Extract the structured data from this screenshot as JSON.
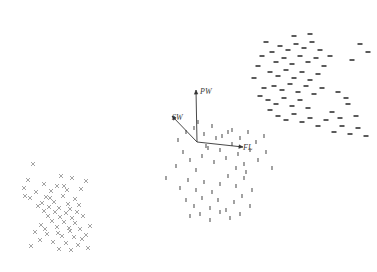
{
  "figure": {
    "name": "scatter-biplot",
    "background_color": "#ffffff",
    "width": 377,
    "height": 272,
    "title": "",
    "xlabel": "",
    "ylabel": "",
    "grid": false,
    "axes_visible": false,
    "legend": "none"
  },
  "chart_data": {
    "type": "scatter",
    "title": "",
    "xlabel": "",
    "ylabel": "",
    "xlim": [
      0,
      377
    ],
    "ylim": [
      272,
      0
    ],
    "grid": false,
    "legend_position": "none",
    "annotations": [
      {
        "text": "PW",
        "x": 200,
        "y": 94,
        "style": "italic"
      },
      {
        "text": "SW",
        "x": 172,
        "y": 120,
        "style": "italic"
      },
      {
        "text": "FL",
        "x": 243,
        "y": 150,
        "style": "italic"
      }
    ],
    "vectors": {
      "origin": {
        "x": 197,
        "y": 142
      },
      "arrows": [
        {
          "label": "PW",
          "x": 196,
          "y": 90,
          "color": "#333333"
        },
        {
          "label": "SW",
          "x": 172,
          "y": 116,
          "color": "#333333"
        },
        {
          "label": "FL",
          "x": 243,
          "y": 147,
          "color": "#333333"
        }
      ]
    },
    "series": [
      {
        "name": "cluster-lower-left",
        "marker": "x",
        "color": "#9a9a9a",
        "size": 4,
        "points": [
          [
            33,
            164
          ],
          [
            28,
            180
          ],
          [
            61,
            176
          ],
          [
            72,
            178
          ],
          [
            44,
            184
          ],
          [
            57,
            186
          ],
          [
            86,
            181
          ],
          [
            24,
            188
          ],
          [
            36,
            192
          ],
          [
            51,
            191
          ],
          [
            67,
            190
          ],
          [
            81,
            189
          ],
          [
            30,
            198
          ],
          [
            46,
            197
          ],
          [
            63,
            196
          ],
          [
            75,
            199
          ],
          [
            42,
            203
          ],
          [
            54,
            202
          ],
          [
            68,
            204
          ],
          [
            49,
            207
          ],
          [
            59,
            208
          ],
          [
            70,
            209
          ],
          [
            44,
            211
          ],
          [
            55,
            212
          ],
          [
            66,
            213
          ],
          [
            77,
            212
          ],
          [
            48,
            216
          ],
          [
            60,
            217
          ],
          [
            72,
            218
          ],
          [
            83,
            216
          ],
          [
            52,
            221
          ],
          [
            64,
            222
          ],
          [
            75,
            223
          ],
          [
            41,
            225
          ],
          [
            57,
            227
          ],
          [
            69,
            228
          ],
          [
            80,
            229
          ],
          [
            35,
            232
          ],
          [
            47,
            234
          ],
          [
            62,
            236
          ],
          [
            74,
            237
          ],
          [
            86,
            235
          ],
          [
            40,
            240
          ],
          [
            53,
            242
          ],
          [
            66,
            243
          ],
          [
            78,
            245
          ],
          [
            31,
            246
          ],
          [
            59,
            249
          ],
          [
            71,
            250
          ],
          [
            88,
            248
          ],
          [
            25,
            196
          ],
          [
            38,
            206
          ],
          [
            50,
            198
          ],
          [
            64,
            186
          ],
          [
            79,
            205
          ],
          [
            90,
            226
          ],
          [
            45,
            229
          ],
          [
            58,
            233
          ],
          [
            70,
            231
          ],
          [
            82,
            239
          ]
        ]
      },
      {
        "name": "cluster-center",
        "marker": "tick",
        "color": "#555555",
        "size": 4,
        "points": [
          [
            166,
            178
          ],
          [
            176,
            166
          ],
          [
            183,
            152
          ],
          [
            190,
            160
          ],
          [
            196,
            170
          ],
          [
            202,
            156
          ],
          [
            208,
            148
          ],
          [
            214,
            162
          ],
          [
            220,
            150
          ],
          [
            226,
            158
          ],
          [
            232,
            144
          ],
          [
            238,
            154
          ],
          [
            244,
            164
          ],
          [
            250,
            150
          ],
          [
            180,
            188
          ],
          [
            188,
            180
          ],
          [
            196,
            190
          ],
          [
            204,
            182
          ],
          [
            212,
            192
          ],
          [
            220,
            184
          ],
          [
            228,
            176
          ],
          [
            236,
            186
          ],
          [
            244,
            178
          ],
          [
            252,
            190
          ],
          [
            186,
            200
          ],
          [
            194,
            206
          ],
          [
            202,
            198
          ],
          [
            210,
            208
          ],
          [
            218,
            200
          ],
          [
            226,
            210
          ],
          [
            234,
            202
          ],
          [
            242,
            196
          ],
          [
            250,
            206
          ],
          [
            190,
            216
          ],
          [
            200,
            214
          ],
          [
            210,
            220
          ],
          [
            220,
            212
          ],
          [
            230,
            218
          ],
          [
            240,
            214
          ],
          [
            178,
            140
          ],
          [
            186,
            132
          ],
          [
            194,
            128
          ],
          [
            204,
            134
          ],
          [
            212,
            126
          ],
          [
            222,
            136
          ],
          [
            232,
            130
          ],
          [
            240,
            138
          ],
          [
            248,
            132
          ],
          [
            256,
            142
          ],
          [
            264,
            136
          ],
          [
            258,
            160
          ],
          [
            266,
            152
          ],
          [
            272,
            168
          ],
          [
            246,
            172
          ],
          [
            236,
            168
          ],
          [
            228,
            132
          ],
          [
            216,
            138
          ],
          [
            206,
            146
          ],
          [
            198,
            122
          ]
        ]
      },
      {
        "name": "cluster-upper-right",
        "marker": "dash",
        "color": "#4a4a4a",
        "size": 5,
        "points": [
          [
            272,
            52
          ],
          [
            280,
            46
          ],
          [
            288,
            50
          ],
          [
            296,
            44
          ],
          [
            304,
            48
          ],
          [
            312,
            42
          ],
          [
            320,
            50
          ],
          [
            276,
            62
          ],
          [
            284,
            58
          ],
          [
            292,
            64
          ],
          [
            300,
            56
          ],
          [
            308,
            62
          ],
          [
            316,
            58
          ],
          [
            324,
            66
          ],
          [
            270,
            72
          ],
          [
            278,
            76
          ],
          [
            286,
            70
          ],
          [
            294,
            78
          ],
          [
            302,
            72
          ],
          [
            310,
            80
          ],
          [
            318,
            74
          ],
          [
            274,
            86
          ],
          [
            282,
            90
          ],
          [
            290,
            84
          ],
          [
            298,
            92
          ],
          [
            306,
            86
          ],
          [
            314,
            94
          ],
          [
            322,
            88
          ],
          [
            268,
            100
          ],
          [
            276,
            104
          ],
          [
            284,
            98
          ],
          [
            292,
            106
          ],
          [
            300,
            100
          ],
          [
            308,
            108
          ],
          [
            266,
            42
          ],
          [
            294,
            36
          ],
          [
            310,
            34
          ],
          [
            330,
            56
          ],
          [
            338,
            92
          ],
          [
            346,
            98
          ],
          [
            352,
            60
          ],
          [
            360,
            44
          ],
          [
            368,
            52
          ],
          [
            332,
            112
          ],
          [
            340,
            118
          ],
          [
            348,
            104
          ],
          [
            356,
            116
          ],
          [
            262,
            56
          ],
          [
            258,
            66
          ],
          [
            254,
            78
          ],
          [
            264,
            88
          ],
          [
            260,
            96
          ],
          [
            270,
            110
          ],
          [
            278,
            116
          ],
          [
            286,
            120
          ],
          [
            294,
            114
          ],
          [
            302,
            122
          ],
          [
            310,
            118
          ],
          [
            318,
            126
          ],
          [
            326,
            120
          ],
          [
            334,
            132
          ],
          [
            342,
            126
          ],
          [
            350,
            134
          ],
          [
            358,
            128
          ],
          [
            366,
            136
          ]
        ]
      }
    ]
  }
}
